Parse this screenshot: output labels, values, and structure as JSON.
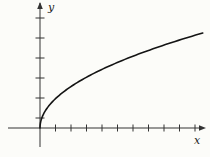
{
  "figure": {
    "background_color": "#fcfcf9",
    "axis_color": "#333333",
    "tick_color": "#333333",
    "curve_color": "#141414",
    "x_axis_label": "x",
    "y_axis_label": "y"
  },
  "chart_data": {
    "type": "line",
    "title": "",
    "xlabel": "x",
    "ylabel": "y",
    "legend": [],
    "grid": false,
    "tick_labels_shown": false,
    "curve": {
      "function": "y = 1.466 * x^0.5 (in tick units)",
      "coefficient": 1.466,
      "exponent": 0.5,
      "x_domain_units": [
        0,
        10.5
      ],
      "sample_points_units": [
        {
          "x": 0,
          "y": 0
        },
        {
          "x": 1,
          "y": 1.47
        },
        {
          "x": 2,
          "y": 2.07
        },
        {
          "x": 4,
          "y": 2.93
        },
        {
          "x": 6,
          "y": 3.59
        },
        {
          "x": 8,
          "y": 4.15
        },
        {
          "x": 10,
          "y": 4.64
        },
        {
          "x": 10.5,
          "y": 4.75
        }
      ]
    },
    "axes": {
      "x_ticks_units": [
        1,
        2,
        3,
        4,
        5,
        6,
        7,
        8,
        9,
        10
      ],
      "y_ticks_count": 6,
      "x_axis_arrow": true,
      "y_axis_arrow": true
    },
    "layout": {
      "origin_px": {
        "x": 40,
        "y": 128
      },
      "x_unit_px": 15.5,
      "y_unit_px": 20,
      "x_axis_start_px": 8,
      "x_axis_end_px": 202,
      "y_axis_top_px": 3,
      "y_axis_bottom_px": 147,
      "y_tick_offsets_px": [
        10,
        30,
        50,
        70,
        90,
        110
      ],
      "x_tick_half_len_px": 3.5,
      "y_tick_half_len_px": 4.5,
      "curve_stroke_width": 1.6,
      "axis_stroke_width": 1,
      "x_label_pos_px": {
        "x": 194,
        "y": 144
      },
      "y_label_pos_px": {
        "x": 48,
        "y": 11
      }
    }
  }
}
